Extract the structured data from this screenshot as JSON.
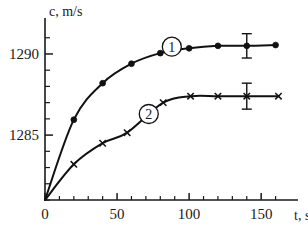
{
  "chart_data": {
    "type": "line",
    "title": "",
    "subtitle": "",
    "xlabel": "t, s",
    "ylabel": "c, m/s",
    "xlim": [
      0,
      170
    ],
    "ylim": [
      1281.0,
      1291.6
    ],
    "grid": false,
    "legend_position": "inline-callout",
    "x_ticks_major": [
      0,
      50,
      100,
      150
    ],
    "x_tick_labels": [
      "0",
      "50",
      "100",
      "150"
    ],
    "x_ticks_minor": [
      10,
      20,
      30,
      40,
      60,
      70,
      80,
      90,
      110,
      120,
      130,
      140,
      160
    ],
    "y_ticks_major": [
      1290,
      1285
    ],
    "y_tick_labels": [
      "1290",
      "1285"
    ],
    "y_ticks_minor": [
      1281,
      1282,
      1283,
      1284,
      1286,
      1287,
      1288,
      1289,
      1291
    ],
    "series": [
      {
        "name": "1",
        "marker": "filled-circle",
        "callout_label": "1",
        "callout_x": 88,
        "callout_y": 1290.45,
        "x": [
          0,
          20,
          40,
          60,
          80,
          100,
          120,
          140,
          160
        ],
        "y": [
          1281.0,
          1285.95,
          1288.2,
          1289.4,
          1290.05,
          1290.35,
          1290.5,
          1290.5,
          1290.55
        ],
        "error_bars": [
          {
            "x": 140,
            "y": 1290.5,
            "yerr": 0.75
          }
        ]
      },
      {
        "name": "2",
        "marker": "cross",
        "callout_label": "2",
        "callout_x": 72,
        "callout_y": 1286.3,
        "x": [
          0,
          20,
          40,
          57,
          82,
          101,
          120,
          140,
          162
        ],
        "y": [
          1281.0,
          1283.2,
          1284.5,
          1285.15,
          1287.0,
          1287.4,
          1287.4,
          1287.4,
          1287.4
        ],
        "error_bars": [
          {
            "x": 140,
            "y": 1287.4,
            "yerr": 0.8
          }
        ]
      }
    ]
  }
}
